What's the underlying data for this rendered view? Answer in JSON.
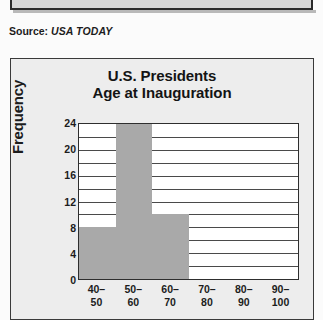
{
  "top_clipped_box": {
    "title": "Total Rebounds"
  },
  "source": {
    "label": "Source:",
    "value": "USA TODAY"
  },
  "chart_data": {
    "type": "bar",
    "title_line1": "U.S. Presidents",
    "title_line2": "Age at Inauguration",
    "title": "U.S. Presidents Age at Inauguration",
    "xlabel": "",
    "ylabel": "Frequency",
    "categories": [
      "40–50",
      "50–60",
      "60–70",
      "70–80",
      "80–90",
      "90–100"
    ],
    "category_lines": [
      [
        "40–",
        "50"
      ],
      [
        "50–",
        "60"
      ],
      [
        "60–",
        "70"
      ],
      [
        "70–",
        "80"
      ],
      [
        "80–",
        "90"
      ],
      [
        "90–",
        "100"
      ]
    ],
    "values": [
      8,
      24,
      10,
      0,
      0,
      0
    ],
    "ylim": [
      0,
      24
    ],
    "ytick_labels": [
      "0",
      "4",
      "8",
      "12",
      "16",
      "20",
      "24"
    ],
    "ytick_values": [
      0,
      4,
      8,
      12,
      16,
      20,
      24
    ],
    "gridline_values": [
      2,
      4,
      6,
      8,
      10,
      12,
      14,
      16,
      18,
      20,
      22
    ],
    "grid": true,
    "legend": "none",
    "bar_gap": 0,
    "colors": {
      "bar_fill": "#a9a9a9",
      "plot_background": "#ffffff",
      "panel_background": "#ededed",
      "axis": "#2e2e2e",
      "text": "#141414"
    }
  }
}
